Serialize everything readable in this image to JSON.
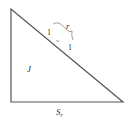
{
  "diagram": {
    "shape": "right-triangle",
    "line_color": "#555555",
    "vertices": {
      "top_left": [
        11,
        9
      ],
      "bottom_left": [
        11,
        102
      ],
      "bottom_right": [
        123,
        102
      ]
    },
    "labels": {
      "interior": "J",
      "base": "S",
      "base_subscript": "r",
      "brace": "r",
      "tick_left": "1",
      "tick_right": "1",
      "middle_mark": "~"
    }
  }
}
